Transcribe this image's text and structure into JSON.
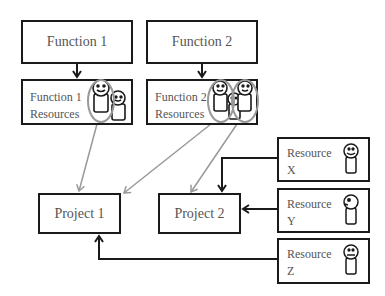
{
  "functions": [
    {
      "title": "Function 1",
      "resources_line1": "Function 1",
      "resources_line2": "Resources"
    },
    {
      "title": "Function 2",
      "resources_line1": "Function 2",
      "resources_line2": "Resources"
    }
  ],
  "projects": [
    {
      "title": "Project 1"
    },
    {
      "title": "Project 2"
    }
  ],
  "resources": [
    {
      "line1": "Resource",
      "line2": "X",
      "face": "smile"
    },
    {
      "line1": "Resource",
      "line2": "Y",
      "face": "side"
    },
    {
      "line1": "Resource",
      "line2": "Z",
      "face": "frown"
    }
  ],
  "colors": {
    "box_border": "#1a1a1a",
    "text": "#555555",
    "black_arrow": "#1a1a1a",
    "gray_arrow": "#999999",
    "highlight_circle": "#999999"
  }
}
